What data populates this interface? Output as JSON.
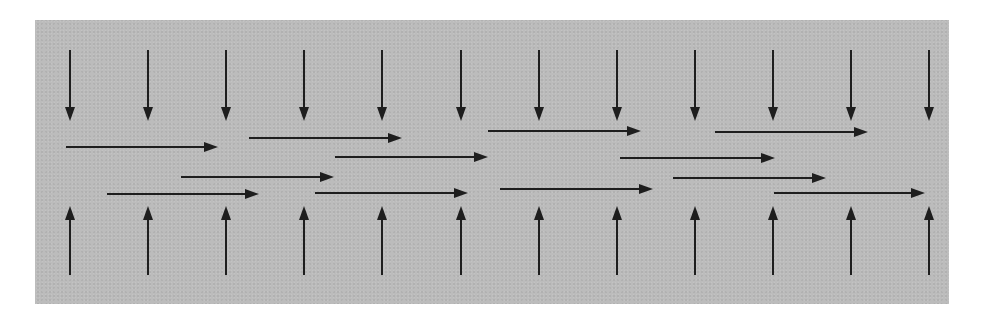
{
  "diagram": {
    "colors": {
      "background": "#bcbcbc",
      "arrow": "#1e1e1e",
      "page": "#ffffff"
    },
    "panel": {
      "x": 35,
      "y": 20,
      "width": 914,
      "height": 284
    },
    "column_x": [
      70,
      148,
      226,
      304,
      382,
      461,
      539,
      617,
      695,
      773,
      851,
      929
    ],
    "down_arrows": {
      "y_start": 50,
      "y_end": 121,
      "direction": "down"
    },
    "up_arrows": {
      "y_start": 275,
      "y_end": 206,
      "direction": "up"
    },
    "horizontal_arrows": [
      {
        "x1": 66,
        "x2": 218,
        "y": 147
      },
      {
        "x1": 107,
        "x2": 259,
        "y": 194
      },
      {
        "x1": 181,
        "x2": 334,
        "y": 177
      },
      {
        "x1": 249,
        "x2": 402,
        "y": 138
      },
      {
        "x1": 315,
        "x2": 468,
        "y": 193
      },
      {
        "x1": 335,
        "x2": 488,
        "y": 157
      },
      {
        "x1": 488,
        "x2": 641,
        "y": 131
      },
      {
        "x1": 500,
        "x2": 653,
        "y": 189
      },
      {
        "x1": 620,
        "x2": 775,
        "y": 158
      },
      {
        "x1": 673,
        "x2": 826,
        "y": 178
      },
      {
        "x1": 715,
        "x2": 868,
        "y": 132
      },
      {
        "x1": 774,
        "x2": 925,
        "y": 193
      }
    ]
  }
}
